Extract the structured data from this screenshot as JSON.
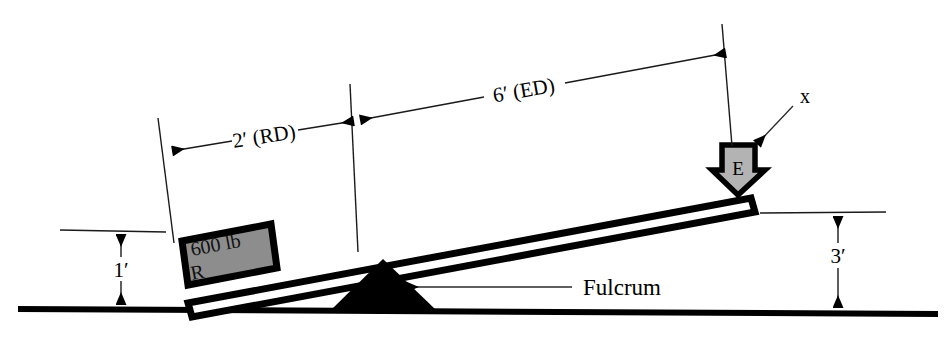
{
  "figure": {
    "background_color": "#ffffff",
    "ink_color": "#000000"
  },
  "dimensions": {
    "resistance_distance": {
      "label": "2′ (RD)",
      "value": 2,
      "unit": "ft",
      "meaning": "resistance distance"
    },
    "effort_distance": {
      "label": "6′ (ED)",
      "value": 6,
      "unit": "ft",
      "meaning": "effort distance"
    },
    "resistance_height": {
      "label": "1′",
      "value": 1,
      "unit": "ft"
    },
    "effort_height": {
      "label": "3′",
      "value": 3,
      "unit": "ft"
    }
  },
  "block": {
    "weight_label": "600 lb",
    "symbol_label": "R",
    "fill_color": "#8d8d8d",
    "meaning": "resistance"
  },
  "effort": {
    "symbol_label": "E",
    "fill_color": "#b3b3b3",
    "callout_label": "x",
    "meaning": "effort"
  },
  "fulcrum": {
    "label": "Fulcrum",
    "fill_color": "#000000"
  }
}
